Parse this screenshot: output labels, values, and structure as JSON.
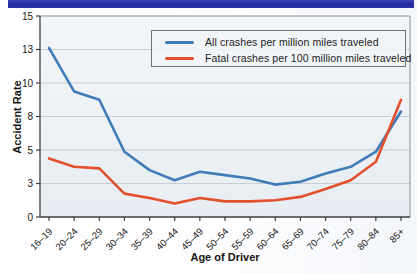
{
  "banner": {
    "color": "#232a9e"
  },
  "chart_data": {
    "type": "line",
    "title": "",
    "xlabel": "Age of Driver",
    "ylabel": "Accident Rate",
    "categories": [
      "16–19",
      "20–24",
      "25–29",
      "30–34",
      "35–39",
      "40–44",
      "45–49",
      "50–54",
      "55–59",
      "60–64",
      "65–69",
      "70–74",
      "75–79",
      "80–84",
      "85+"
    ],
    "y_ticks": [
      0,
      3,
      5,
      8,
      10,
      13,
      15
    ],
    "y_tick_labels": [
      "0",
      "3",
      "5",
      "8",
      "10",
      "13",
      "15"
    ],
    "y_tick_spacing": "equal pixel spacing between ticks despite uneven values",
    "ylim": [
      0,
      15
    ],
    "grid": "horizontal gridlines only",
    "legend_position": "upper right inside plot",
    "series": [
      {
        "name": "All crashes per million miles traveled",
        "color": "#3f7cb8",
        "values": [
          13.1,
          9.5,
          9.0,
          4.9,
          3.8,
          3.2,
          3.7,
          3.5,
          3.3,
          2.9,
          3.1,
          3.6,
          4.0,
          4.9,
          8.3
        ]
      },
      {
        "name": "Fatal crashes per 100 million miles traveled",
        "color": "#e2502c",
        "values": [
          4.5,
          4.0,
          3.9,
          2.1,
          1.7,
          1.2,
          1.7,
          1.4,
          1.4,
          1.5,
          1.8,
          2.5,
          3.2,
          4.3,
          9.0
        ]
      }
    ]
  }
}
